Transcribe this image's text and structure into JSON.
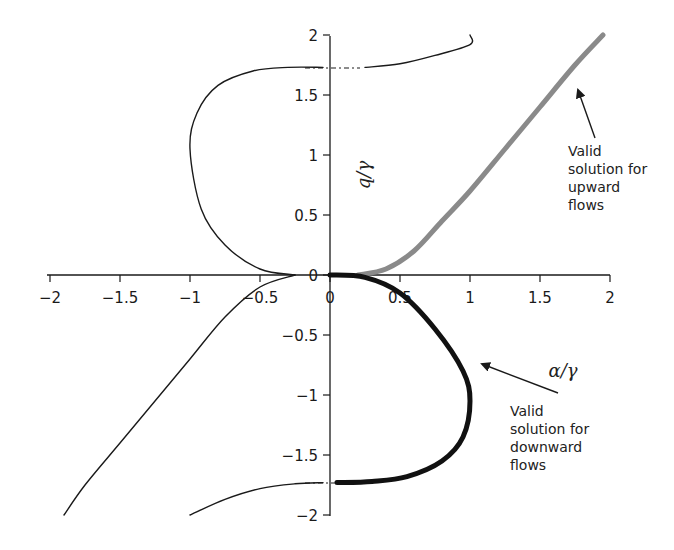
{
  "chart_data": {
    "type": "line",
    "title": "",
    "xlabel": "α/γ",
    "ylabel": "q/γ",
    "xlim": [
      -2,
      2
    ],
    "ylim": [
      -2,
      2
    ],
    "grid": false,
    "x_ticks": [
      "−2",
      "−1.5",
      "−1",
      "−0.5",
      "0",
      "0.5",
      "1",
      "1.5",
      "2"
    ],
    "y_ticks_pos": [
      "2",
      "1.5",
      "1",
      "0.5",
      "0"
    ],
    "y_ticks_neg": [
      "−0.5",
      "−1",
      "−1.5",
      "−2"
    ],
    "series": [
      {
        "name": "Upper-left branch (thin)",
        "style": "thin black",
        "points": [
          [
            -0.25,
            0.0
          ],
          [
            -0.5,
            0.05
          ],
          [
            -0.75,
            0.25
          ],
          [
            -0.92,
            0.55
          ],
          [
            -1.0,
            1.05
          ],
          [
            -0.95,
            1.35
          ],
          [
            -0.8,
            1.58
          ],
          [
            -0.55,
            1.7
          ],
          [
            -0.3,
            1.73
          ],
          [
            -0.05,
            1.73
          ]
        ]
      },
      {
        "name": "Upper-right branch (thin)",
        "style": "thin black",
        "points": [
          [
            0.25,
            1.73
          ],
          [
            0.5,
            1.76
          ],
          [
            0.75,
            1.83
          ],
          [
            1.0,
            1.92
          ],
          [
            1.0,
            2.0
          ]
        ]
      },
      {
        "name": "Lower-left branch (thin)",
        "style": "thin black",
        "points": [
          [
            -0.25,
            0.0
          ],
          [
            -0.5,
            -0.1
          ],
          [
            -0.75,
            -0.35
          ],
          [
            -1.0,
            -0.7
          ],
          [
            -1.25,
            -1.05
          ],
          [
            -1.5,
            -1.4
          ],
          [
            -1.75,
            -1.75
          ],
          [
            -1.9,
            -2.0
          ]
        ]
      },
      {
        "name": "Lower-left lower branch (thin)",
        "style": "thin black",
        "points": [
          [
            -1.0,
            -2.0
          ],
          [
            -0.75,
            -1.87
          ],
          [
            -0.5,
            -1.78
          ],
          [
            -0.25,
            -1.74
          ],
          [
            -0.05,
            -1.73
          ]
        ]
      },
      {
        "name": "Valid solution for upward flows",
        "style": "thick gray",
        "color": "#8a8a8a",
        "points": [
          [
            0.2,
            0.0
          ],
          [
            0.4,
            0.05
          ],
          [
            0.6,
            0.2
          ],
          [
            0.8,
            0.45
          ],
          [
            1.0,
            0.7
          ],
          [
            1.25,
            1.05
          ],
          [
            1.5,
            1.4
          ],
          [
            1.75,
            1.75
          ],
          [
            1.95,
            2.0
          ]
        ]
      },
      {
        "name": "Valid solution for downward flows",
        "style": "thick black",
        "color": "#111111",
        "points": [
          [
            0.0,
            0.0
          ],
          [
            0.25,
            -0.02
          ],
          [
            0.5,
            -0.15
          ],
          [
            0.75,
            -0.45
          ],
          [
            0.95,
            -0.8
          ],
          [
            1.0,
            -1.05
          ],
          [
            0.95,
            -1.35
          ],
          [
            0.8,
            -1.55
          ],
          [
            0.55,
            -1.68
          ],
          [
            0.3,
            -1.72
          ],
          [
            0.05,
            -1.73
          ]
        ]
      }
    ],
    "dashed_asymptotes": [
      1.73,
      -1.73
    ],
    "annotations": [
      {
        "text": "Valid solution for upward flows",
        "target": "gray curve near (1.75, 1.65)"
      },
      {
        "text": "Valid solution for downward flows",
        "target": "black curve near (1.0, -0.9)"
      },
      {
        "text": "α/γ",
        "position": "near (1.5, -0.75)"
      },
      {
        "text": "q/γ",
        "position": "near (0.2, 0.85)"
      }
    ]
  },
  "labels": {
    "ylabel": "q/γ",
    "xlabel": "α/γ",
    "upward": [
      "Valid",
      "solution for",
      "upward",
      "flows"
    ],
    "downward": [
      "Valid",
      "solution for",
      "downward",
      "flows"
    ]
  }
}
